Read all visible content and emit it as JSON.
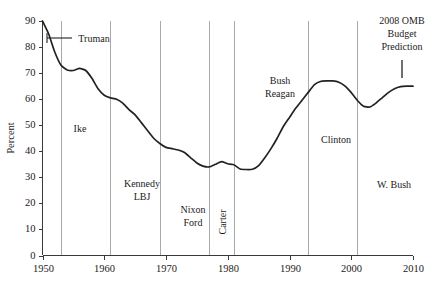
{
  "chart_data": {
    "type": "line",
    "title": "",
    "xlabel": "",
    "ylabel": "Percent",
    "xlim": [
      1950,
      2010
    ],
    "ylim": [
      0,
      90
    ],
    "xticks": [
      "1950",
      "1960",
      "1970",
      "1980",
      "1990",
      "2000",
      "2010"
    ],
    "xtick_values": [
      1950,
      1960,
      1970,
      1980,
      1990,
      2000,
      2010
    ],
    "yticks": [
      "0",
      "10",
      "20",
      "30",
      "40",
      "50",
      "60",
      "70",
      "80",
      "90"
    ],
    "ytick_values": [
      0,
      10,
      20,
      30,
      40,
      50,
      60,
      70,
      80,
      90
    ],
    "grid": false,
    "legend": "none",
    "series": [
      {
        "name": "Percent",
        "x": [
          1950,
          1951,
          1952,
          1953,
          1954,
          1955,
          1956,
          1957,
          1958,
          1959,
          1960,
          1961,
          1962,
          1963,
          1964,
          1965,
          1966,
          1967,
          1968,
          1969,
          1970,
          1971,
          1972,
          1973,
          1974,
          1975,
          1976,
          1977,
          1978,
          1979,
          1980,
          1981,
          1982,
          1983,
          1984,
          1985,
          1986,
          1987,
          1988,
          1989,
          1990,
          1991,
          1992,
          1993,
          1994,
          1995,
          1996,
          1997,
          1998,
          1999,
          2000,
          2001,
          2002,
          2003,
          2004,
          2005,
          2006,
          2007,
          2008,
          2009,
          2010
        ],
        "y": [
          90.0,
          85.0,
          78.0,
          73.0,
          71.2,
          71.0,
          71.8,
          71.0,
          68.0,
          64.0,
          61.5,
          60.5,
          60.0,
          58.5,
          56.0,
          54.0,
          51.0,
          48.0,
          45.0,
          43.0,
          41.5,
          41.0,
          40.5,
          39.5,
          37.5,
          35.5,
          34.3,
          34.0,
          35.0,
          36.0,
          35.2,
          34.8,
          33.2,
          33.0,
          33.1,
          34.5,
          37.5,
          41.0,
          45.0,
          49.5,
          53.0,
          56.5,
          59.5,
          62.5,
          65.5,
          66.8,
          67.0,
          67.0,
          66.5,
          65.0,
          62.5,
          59.5,
          57.3,
          57.0,
          58.5,
          60.5,
          62.5,
          64.0,
          64.8,
          65.0,
          65.0
        ]
      }
    ],
    "eras": [
      {
        "name": "truman",
        "label": "Truman",
        "start": 1950,
        "end": 1953,
        "style": "leader"
      },
      {
        "name": "ike",
        "label": "Ike",
        "start": 1953,
        "end": 1961,
        "style": "horizontal"
      },
      {
        "name": "kennedy-lbj",
        "label": "Kennedy\nLBJ",
        "line1": "Kennedy",
        "line2": "LBJ",
        "start": 1961,
        "end": 1969,
        "style": "horizontal"
      },
      {
        "name": "nixon-ford",
        "label": "Nixon\nFord",
        "line1": "Nixon",
        "line2": "Ford",
        "start": 1969,
        "end": 1977,
        "style": "horizontal"
      },
      {
        "name": "carter",
        "label": "Carter",
        "start": 1977,
        "end": 1981,
        "style": "rotated"
      },
      {
        "name": "bush-reagan",
        "label": "Bush\nReagan",
        "line1": "Bush",
        "line2": "Reagan",
        "start": 1981,
        "end": 1993,
        "style": "horizontal"
      },
      {
        "name": "clinton",
        "label": "Clinton",
        "start": 1993,
        "end": 2001,
        "style": "horizontal"
      },
      {
        "name": "w-bush",
        "label": "W. Bush",
        "start": 2001,
        "end": 2010,
        "style": "horizontal"
      }
    ],
    "divider_years": [
      1953,
      1961,
      1969,
      1977,
      1981,
      1993,
      2001
    ],
    "annotations": [
      {
        "name": "omb-prediction",
        "line1": "2008 OMB",
        "line2": "Budget",
        "line3": "Prediction",
        "at_x": 2007,
        "at_y": 78
      }
    ]
  },
  "axis": {
    "y_title": "Percent",
    "y_labels": [
      "90",
      "80",
      "70",
      "60",
      "50",
      "40",
      "30",
      "20",
      "10",
      "0"
    ],
    "x_labels": [
      "1950",
      "1960",
      "1970",
      "1980",
      "1990",
      "2000",
      "2010"
    ]
  },
  "labels": {
    "truman": "Truman",
    "ike": "Ike",
    "kennedy": "Kennedy",
    "lbj": "LBJ",
    "nixon": "Nixon",
    "ford": "Ford",
    "carter": "Carter",
    "bush": "Bush",
    "reagan": "Reagan",
    "clinton": "Clinton",
    "w_bush": "W. Bush",
    "omb_line1": "2008 OMB",
    "omb_line2": "Budget",
    "omb_line3": "Prediction"
  },
  "colors": {
    "data_line": "#23221f",
    "divider": "#a9a9ad",
    "axis": "#3a3a3a",
    "text": "#1b1b1b",
    "background": "#ffffff"
  }
}
